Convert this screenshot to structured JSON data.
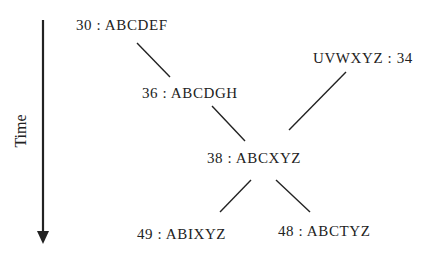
{
  "axis": {
    "label": "Time",
    "direction": "down"
  },
  "nodes": [
    {
      "id": "n30",
      "label": "30 : ABCDEF"
    },
    {
      "id": "n36",
      "label": "36 : ABCDGH"
    },
    {
      "id": "n34",
      "label": "UVWXYZ : 34"
    },
    {
      "id": "n38",
      "label": "38 : ABCXYZ"
    },
    {
      "id": "n49",
      "label": "49 : ABIXYZ"
    },
    {
      "id": "n48",
      "label": "48 : ABCTYZ"
    }
  ],
  "edges": [
    {
      "from": "30 : ABCDEF",
      "to": "36 : ABCDGH"
    },
    {
      "from": "36 : ABCDGH",
      "to": "38 : ABCXYZ"
    },
    {
      "from": "UVWXYZ : 34",
      "to": "38 : ABCXYZ"
    },
    {
      "from": "38 : ABCXYZ",
      "to": "49 : ABIXYZ"
    },
    {
      "from": "38 : ABCXYZ",
      "to": "48 : ABCTYZ"
    }
  ],
  "colors": {
    "line": "#222222",
    "text": "#222222",
    "background": "#ffffff"
  }
}
